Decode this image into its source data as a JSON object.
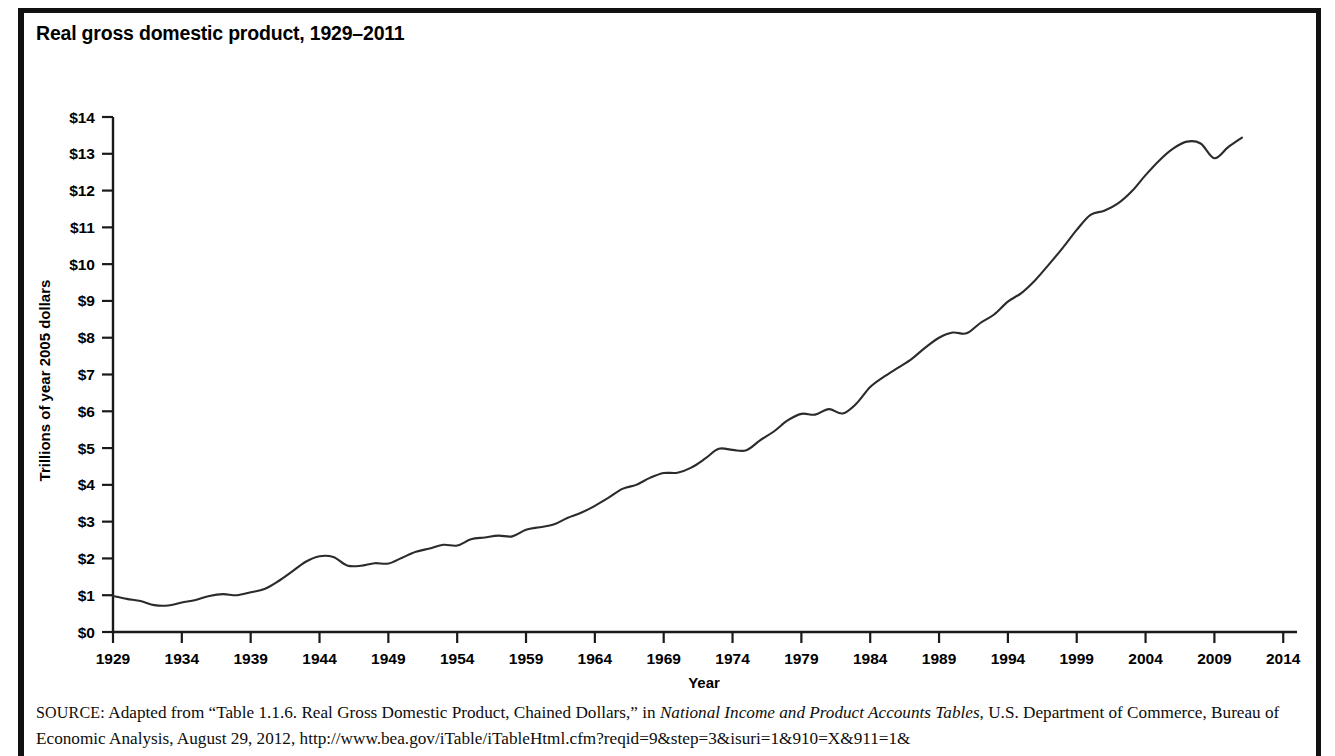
{
  "figure": {
    "title": "Real gross domestic product, 1929–2011"
  },
  "source": {
    "label": "SOURCE:",
    "line1_a": " Adapted from “Table 1.1.6. Real Gross Domestic Product, Chained Dollars,” in ",
    "line1_italic": "National Income and Product Accounts Tables",
    "line1_b": ", U.S. Department",
    "line2": "of Commerce, Bureau of Economic Analysis, August 29, 2012, http://www.bea.gov/iTable/iTableHtml.cfm?reqid=9&step=3&isuri=1&910=X&911=1&"
  },
  "chart_data": {
    "type": "line",
    "title": "Real gross domestic product, 1929–2011",
    "xlabel": "Year",
    "ylabel": "Trillions of year 2005 dollars",
    "xlim": [
      1929,
      2015
    ],
    "ylim": [
      0,
      14
    ],
    "grid": false,
    "legend": null,
    "x_tick_labels": [
      "1929",
      "1934",
      "1939",
      "1944",
      "1949",
      "1954",
      "1959",
      "1964",
      "1969",
      "1974",
      "1979",
      "1984",
      "1989",
      "1994",
      "1999",
      "2004",
      "2009",
      "2014"
    ],
    "x_ticks": [
      1929,
      1934,
      1939,
      1944,
      1949,
      1954,
      1959,
      1964,
      1969,
      1974,
      1979,
      1984,
      1989,
      1994,
      1999,
      2004,
      2009,
      2014
    ],
    "y_tick_labels": [
      "$0",
      "$1",
      "$2",
      "$3",
      "$4",
      "$5",
      "$6",
      "$7",
      "$8",
      "$9",
      "$10",
      "$11",
      "$12",
      "$13",
      "$14"
    ],
    "y_ticks": [
      0,
      1,
      2,
      3,
      4,
      5,
      6,
      7,
      8,
      9,
      10,
      11,
      12,
      13,
      14
    ],
    "series": [
      {
        "name": "Real GDP",
        "x": [
          1929,
          1930,
          1931,
          1932,
          1933,
          1934,
          1935,
          1936,
          1937,
          1938,
          1939,
          1940,
          1941,
          1942,
          1943,
          1944,
          1945,
          1946,
          1947,
          1948,
          1949,
          1950,
          1951,
          1952,
          1953,
          1954,
          1955,
          1956,
          1957,
          1958,
          1959,
          1960,
          1961,
          1962,
          1963,
          1964,
          1965,
          1966,
          1967,
          1968,
          1969,
          1970,
          1971,
          1972,
          1973,
          1974,
          1975,
          1976,
          1977,
          1978,
          1979,
          1980,
          1981,
          1982,
          1983,
          1984,
          1985,
          1986,
          1987,
          1988,
          1989,
          1990,
          1991,
          1992,
          1993,
          1994,
          1995,
          1996,
          1997,
          1998,
          1999,
          2000,
          2001,
          2002,
          2003,
          2004,
          2005,
          2006,
          2007,
          2008,
          2009,
          2010,
          2011
        ],
        "y": [
          0.98,
          0.9,
          0.84,
          0.73,
          0.72,
          0.8,
          0.87,
          0.98,
          1.03,
          1.0,
          1.08,
          1.17,
          1.38,
          1.64,
          1.91,
          2.06,
          2.04,
          1.81,
          1.8,
          1.87,
          1.86,
          2.02,
          2.18,
          2.27,
          2.37,
          2.35,
          2.52,
          2.57,
          2.62,
          2.6,
          2.78,
          2.85,
          2.92,
          3.1,
          3.24,
          3.43,
          3.65,
          3.89,
          4.0,
          4.19,
          4.32,
          4.33,
          4.47,
          4.71,
          4.98,
          4.95,
          4.94,
          5.21,
          5.45,
          5.75,
          5.93,
          5.91,
          6.06,
          5.94,
          6.21,
          6.66,
          6.94,
          7.18,
          7.42,
          7.73,
          8.0,
          8.14,
          8.12,
          8.4,
          8.63,
          8.98,
          9.22,
          9.57,
          10.0,
          10.45,
          10.93,
          11.34,
          11.45,
          11.65,
          11.98,
          12.42,
          12.82,
          13.14,
          13.33,
          13.28,
          12.88,
          13.18,
          13.44
        ]
      }
    ]
  }
}
